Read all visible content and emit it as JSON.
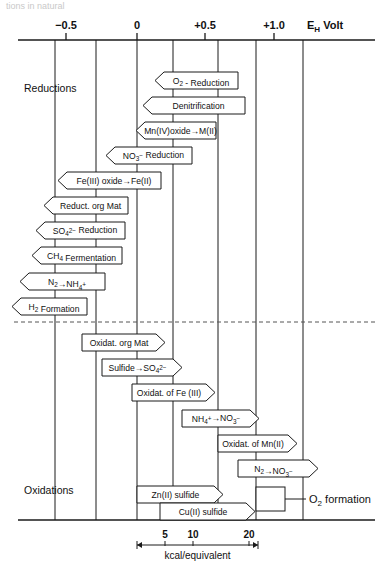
{
  "figure": {
    "top_fragment": "tions in natural",
    "axis": {
      "unit_label": "E",
      "unit_sub": "H",
      "unit_suffix": "Volt",
      "ticks": [
        {
          "label": "−0.5",
          "value": -0.5,
          "x": 66
        },
        {
          "label": "0",
          "value": 0.0,
          "x": 137
        },
        {
          "label": "+0.5",
          "value": 0.5,
          "x": 205
        },
        {
          "label": "+1.0",
          "value": 1.0,
          "x": 274
        }
      ],
      "gridlines": [
        55,
        96,
        137,
        173,
        218,
        256,
        303
      ]
    },
    "section_labels": {
      "reductions": "Reductions",
      "oxidations": "Oxidations"
    },
    "scale": {
      "caption": "kcal/equivalent",
      "ticks": [
        {
          "label": "5",
          "x": 165
        },
        {
          "label": "10",
          "x": 193
        },
        {
          "label": "20",
          "x": 249
        }
      ],
      "bar_start": 137,
      "bar_end": 258
    },
    "callout": {
      "label": "O",
      "label_sub": "2",
      "label_rest": " formation",
      "box_x": 256,
      "box_y": 487,
      "box_w": 29,
      "box_h": 24,
      "leader_x2": 306
    },
    "reductions": [
      {
        "name": "o2-reduction",
        "text": "O₂ - Reduction",
        "x": 155,
        "y": 72,
        "w": 83,
        "dir": "left"
      },
      {
        "name": "denitrification",
        "text": "Denitrification",
        "x": 143,
        "y": 97,
        "w": 102,
        "dir": "left"
      },
      {
        "name": "mn-oxide-reduction",
        "text": "Mn(IV)oxide→M(II)",
        "x": 136,
        "y": 122,
        "w": 80,
        "dir": "left"
      },
      {
        "name": "no3-reduction",
        "text": "NO₃⁻ Reduction",
        "x": 106,
        "y": 147,
        "w": 86,
        "dir": "left"
      },
      {
        "name": "fe-oxide-reduction",
        "text": "Fe(III) oxide→Fe(II)",
        "x": 58,
        "y": 172,
        "w": 103,
        "dir": "left"
      },
      {
        "name": "reduct-org-mat",
        "text": "Reduct. org Mat",
        "x": 44,
        "y": 197,
        "w": 84,
        "dir": "left"
      },
      {
        "name": "so4-reduction",
        "text": "SO₄²⁻ Reduction",
        "x": 36,
        "y": 222,
        "w": 89,
        "dir": "left"
      },
      {
        "name": "ch4-fermentation",
        "text": "CH₄ Fermentation",
        "x": 32,
        "y": 247,
        "w": 90,
        "dir": "left"
      },
      {
        "name": "n2-to-nh4",
        "text": "N₂→NH₄⁺",
        "x": 20,
        "y": 273,
        "w": 85,
        "dir": "left"
      },
      {
        "name": "h2-formation",
        "text": "H₂ Formation",
        "x": 12,
        "y": 298,
        "w": 75,
        "dir": "left"
      }
    ],
    "oxidations": [
      {
        "name": "oxidat-org-mat",
        "text": "Oxidat. org Mat",
        "x": 82,
        "y": 334,
        "w": 83,
        "dir": "right"
      },
      {
        "name": "sulfide-to-so4",
        "text": "Sulfide→SO₄²⁻",
        "x": 102,
        "y": 359,
        "w": 80,
        "dir": "right"
      },
      {
        "name": "oxidat-of-fe",
        "text": "Oxidat. of Fe (III)",
        "x": 132,
        "y": 384,
        "w": 83,
        "dir": "right"
      },
      {
        "name": "nh4-to-no3",
        "text": "NH₄⁺→NO₃⁻",
        "x": 182,
        "y": 410,
        "w": 77,
        "dir": "right"
      },
      {
        "name": "oxidat-of-mn",
        "text": "Oxidat. of Mn(II)",
        "x": 218,
        "y": 435,
        "w": 79,
        "dir": "right"
      },
      {
        "name": "n2-to-no3",
        "text": "N₂→NO₃⁻",
        "x": 238,
        "y": 460,
        "w": 80,
        "dir": "right"
      },
      {
        "name": "zn-sulfide",
        "text": "Zn(II) sulfide",
        "x": 137,
        "y": 486,
        "w": 86,
        "dir": "right"
      },
      {
        "name": "cu-sulfide",
        "text": "Cu(II) sulfide",
        "x": 160,
        "y": 503,
        "w": 95,
        "dir": "right"
      }
    ],
    "layout": {
      "axis_y": 40,
      "axis_x1": 18,
      "axis_x2": 375,
      "bottom_y": 520,
      "divider_y": 322,
      "divider_x1": 14,
      "divider_x2": 378,
      "grid_top": 40,
      "grid_bottom": 520,
      "box_h": 17
    }
  }
}
